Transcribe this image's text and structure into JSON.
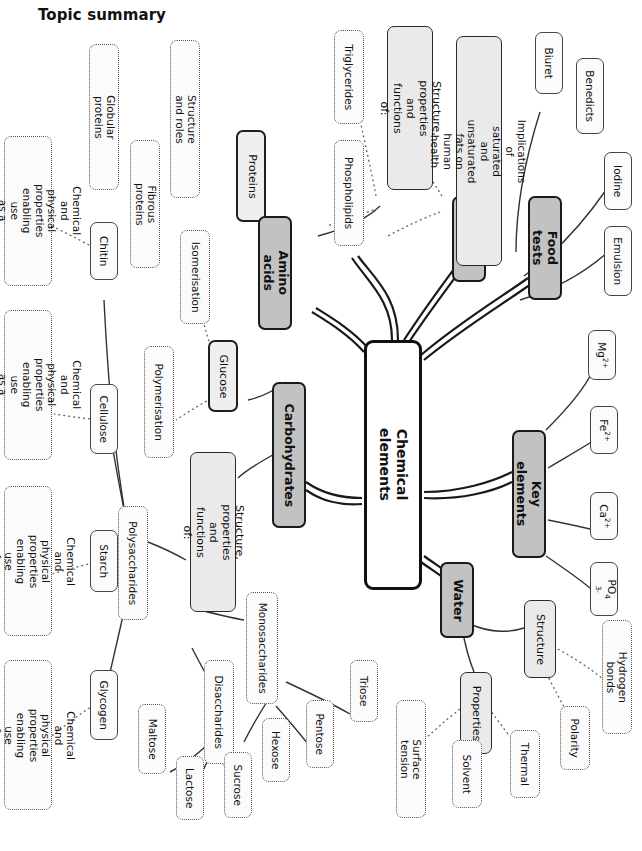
{
  "page": {
    "title": "Topic summary"
  },
  "diagram": {
    "type": "mind-map",
    "center": {
      "label": "Chemical elements"
    },
    "branches": [
      {
        "label": "Proteins",
        "children": [
          {
            "label": "Structure and roles",
            "children": [
              {
                "label": "Globular proteins"
              },
              {
                "label": "Fibrous proteins"
              }
            ]
          }
        ]
      },
      {
        "label": "Amino acids",
        "children": []
      },
      {
        "label": "Lipids",
        "children": [
          {
            "label": "Structure, properties\nand functions of:",
            "children": [
              {
                "label": "Triglycerides"
              },
              {
                "label": "Phospholipids"
              }
            ]
          },
          {
            "label": "Implications of saturated and\nunsaturated fats on human health"
          }
        ]
      },
      {
        "label": "Food tests",
        "children": [
          {
            "label": "Biuret"
          },
          {
            "label": "Benedicts"
          },
          {
            "label": "Iodine"
          },
          {
            "label": "Emulsion"
          }
        ]
      },
      {
        "label": "Key elements",
        "children": [
          {
            "label": "Mg2+"
          },
          {
            "label": "Fe2+"
          },
          {
            "label": "Ca2+"
          },
          {
            "label": "PO43-"
          }
        ]
      },
      {
        "label": "Water",
        "children": [
          {
            "label": "Structure",
            "children": [
              {
                "label": "Hydrogen bonds"
              },
              {
                "label": "Polarity"
              }
            ]
          },
          {
            "label": "Properties",
            "children": [
              {
                "label": "Surface tension"
              },
              {
                "label": "Solvent"
              },
              {
                "label": "Thermal"
              }
            ]
          }
        ]
      },
      {
        "label": "Carbohydrates",
        "children": [
          {
            "label": "Glucose",
            "children": [
              {
                "label": "Isomerisation"
              },
              {
                "label": "Polymerisation"
              }
            ]
          },
          {
            "label": "Structure, properties\nand functions of:",
            "children": [
              {
                "label": "Monosaccharides",
                "children": [
                  {
                    "label": "Triose"
                  },
                  {
                    "label": "Pentose"
                  },
                  {
                    "label": "Hexose"
                  }
                ]
              },
              {
                "label": "Disaccharides",
                "children": [
                  {
                    "label": "Maltose"
                  },
                  {
                    "label": "Lactose"
                  },
                  {
                    "label": "Sucrose"
                  }
                ]
              },
              {
                "label": "Polysaccharides",
                "children": [
                  {
                    "label": "Chitin",
                    "note": "Chemical and physical\nproperties enabling use\nas a structural compound"
                  },
                  {
                    "label": "Cellulose",
                    "note": "Chemical and physical\nproperties enabling use\nas a structural compound"
                  },
                  {
                    "label": "Starch",
                    "note": "Chemical and physical\nproperties enabling use\nfor storage"
                  },
                  {
                    "label": "Glycogen",
                    "note": "Chemical and physical\nproperties enabling use\nfor storage"
                  }
                ]
              }
            ]
          }
        ]
      }
    ]
  },
  "nodes": {
    "center": "Chemical elements",
    "proteins": "Proteins",
    "structure_roles": "Structure and roles",
    "globular": "Globular proteins",
    "fibrous": "Fibrous proteins",
    "amino_acids": "Amino acids",
    "lipids": "Lipids",
    "lipid_struct": "Structure, properties\nand functions of:",
    "triglycerides": "Triglycerides",
    "phospholipids": "Phospholipids",
    "implications": "Implications of saturated and\nunsaturated fats on human health",
    "food_tests": "Food tests",
    "biuret": "Biuret",
    "benedicts": "Benedicts",
    "iodine": "Iodine",
    "emulsion": "Emulsion",
    "key_elements": "Key elements",
    "water": "Water",
    "structure": "Structure",
    "hydrogen_bonds": "Hydrogen bonds",
    "polarity": "Polarity",
    "properties": "Properties",
    "surface_tension": "Surface tension",
    "solvent": "Solvent",
    "thermal": "Thermal",
    "carbohydrates": "Carbohydrates",
    "glucose": "Glucose",
    "isomerisation": "Isomerisation",
    "polymerisation": "Polymerisation",
    "carb_struct": "Structure, properties\nand functions of:",
    "monosaccharides": "Monosaccharides",
    "triose": "Triose",
    "pentose": "Pentose",
    "hexose": "Hexose",
    "disaccharides": "Disaccharides",
    "maltose": "Maltose",
    "lactose": "Lactose",
    "sucrose": "Sucrose",
    "polysaccharides": "Polysaccharides",
    "chitin": "Chitin",
    "cellulose": "Cellulose",
    "starch": "Starch",
    "glycogen": "Glycogen",
    "note_structural_1": "Chemical and physical\nproperties enabling use\nas a structural compound",
    "note_structural_2": "Chemical and physical\nproperties enabling use\nas a structural compound",
    "note_storage_1": "Chemical and physical\nproperties enabling use\nfor storage",
    "note_storage_2": "Chemical and physical\nproperties enabling use\nfor storage"
  },
  "colors": {
    "center_fill": "#ffffff",
    "branch_fill": "#c2c2c2",
    "sub_fill": "#eaeaea",
    "leaf_fill": "#fbfbfb",
    "stroke": "#1a1a1a",
    "text": "#111111"
  }
}
